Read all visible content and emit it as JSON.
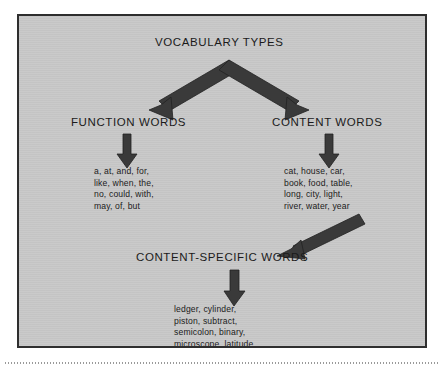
{
  "diagram": {
    "title": "VOCABULARY TYPES",
    "nodes": {
      "function_words": {
        "label": "FUNCTION WORDS",
        "examples": [
          "a, at, and, for,",
          "like, when, the,",
          "no, could, with,",
          "may, of, but"
        ]
      },
      "content_words": {
        "label": "CONTENT WORDS",
        "examples": [
          "cat, house, car,",
          "book, food, table,",
          "long, city, light,",
          "river, water, year"
        ]
      },
      "content_specific_words": {
        "label": "CONTENT-SPECIFIC WORDS",
        "examples": [
          "ledger, cylinder,",
          "piston, subtract,",
          "semicolon, binary,",
          "microscope, latitude,",
          "revenue, feudal"
        ]
      }
    },
    "connectors": [
      {
        "name": "split-arrow-to-function-and-content",
        "from": "VOCABULARY TYPES",
        "to": [
          "FUNCTION WORDS",
          "CONTENT WORDS"
        ],
        "style": "chevron-double-headed"
      },
      {
        "name": "arrow-function-words-to-examples",
        "from": "FUNCTION WORDS",
        "to": "function word examples",
        "style": "down"
      },
      {
        "name": "arrow-content-words-to-examples",
        "from": "CONTENT WORDS",
        "to": "content word examples",
        "style": "down"
      },
      {
        "name": "arrow-content-words-to-content-specific",
        "from": "content word examples",
        "to": "CONTENT-SPECIFIC WORDS",
        "style": "diagonal-down-left"
      },
      {
        "name": "arrow-content-specific-to-examples",
        "from": "CONTENT-SPECIFIC WORDS",
        "to": "content-specific word examples",
        "style": "down"
      }
    ],
    "colors": {
      "panel_background": "#c8c8c8",
      "panel_border": "#2e2e2e",
      "text": "#1b1b1b",
      "arrow_fill": "#3a3a3a",
      "page_background": "#ffffff"
    }
  }
}
